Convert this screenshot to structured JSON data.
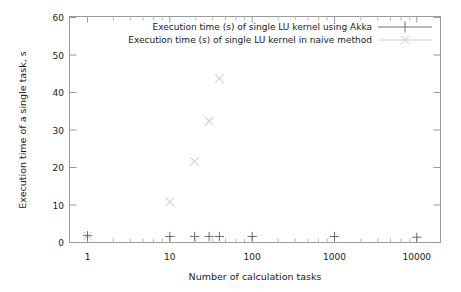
{
  "chart_data": {
    "type": "scatter",
    "title": "",
    "xlabel": "Number of calculation tasks",
    "ylabel": "Execution time of a single task, s",
    "xscale": "log",
    "yscale": "linear",
    "xlim": [
      0.6,
      18000
    ],
    "ylim": [
      0,
      60
    ],
    "ytick_labels": [
      "0",
      "10",
      "20",
      "30",
      "40",
      "50",
      "60"
    ],
    "ytick_values": [
      0,
      10,
      20,
      30,
      40,
      50,
      60
    ],
    "xtick_labels": [
      "1",
      "10",
      "100",
      "1000",
      "10000"
    ],
    "xtick_values": [
      1,
      10,
      100,
      1000,
      10000
    ],
    "grid": false,
    "legend_position": "top-right-inside",
    "series": [
      {
        "name": "Execution time (s) of single  LU kernel using Akka",
        "marker": "plus",
        "color": "#6b6b6b",
        "points": [
          {
            "x": 1,
            "y": 1.8
          },
          {
            "x": 10,
            "y": 1.6
          },
          {
            "x": 20,
            "y": 1.6
          },
          {
            "x": 30,
            "y": 1.6
          },
          {
            "x": 40,
            "y": 1.6
          },
          {
            "x": 100,
            "y": 1.6
          },
          {
            "x": 1000,
            "y": 1.6
          },
          {
            "x": 10000,
            "y": 1.4
          }
        ]
      },
      {
        "name": "Execution time (s) of single LU kernel in naive method",
        "marker": "cross",
        "color": "#d2d2d2",
        "points": [
          {
            "x": 1,
            "y": 1.7
          },
          {
            "x": 10,
            "y": 10.8
          },
          {
            "x": 20,
            "y": 21.5
          },
          {
            "x": 30,
            "y": 32.2
          },
          {
            "x": 40,
            "y": 43.5
          }
        ]
      }
    ]
  },
  "legend": {
    "entries": [
      {
        "label": "Execution time (s) of single  LU kernel using Akka",
        "marker": "plus"
      },
      {
        "label": "Execution time (s) of single LU kernel in naive method",
        "marker": "cross"
      }
    ]
  },
  "colors": {
    "series_akka": "#6b6b6b",
    "series_naive": "#d2d2d2",
    "axis": "#9a9a9a",
    "text": "#1a1a1a",
    "background": "#ffffff"
  }
}
